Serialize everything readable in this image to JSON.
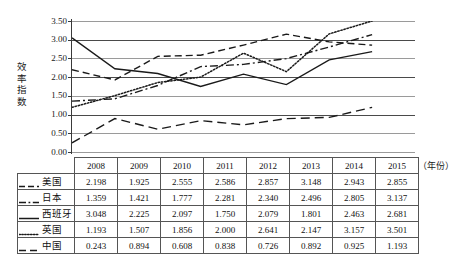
{
  "figure": {
    "y_axis_title": "效率指数",
    "y_axis_title_chars": [
      "效",
      "率",
      "指",
      "数"
    ],
    "x_axis_note": "（年份）",
    "y_ticks": [
      "3.50",
      "3.00",
      "2.50",
      "2.00",
      "1.50",
      "1.00",
      "0.50",
      "0.00"
    ]
  },
  "chart_data": {
    "type": "line",
    "title": "",
    "xlabel": "（年份）",
    "ylabel": "效率指数",
    "ylim": [
      0.0,
      3.5
    ],
    "yticks": [
      0.0,
      0.5,
      1.0,
      1.5,
      2.0,
      2.5,
      3.0,
      3.5
    ],
    "grid": true,
    "legend_position": "table-row-headers",
    "categories": [
      "2008",
      "2009",
      "2010",
      "2011",
      "2012",
      "2013",
      "2014",
      "2015"
    ],
    "series": [
      {
        "name": "美国",
        "style": "dashed",
        "color": "#1a1a1a",
        "values": [
          2.198,
          1.925,
          2.555,
          2.586,
          2.857,
          3.148,
          2.943,
          2.855
        ]
      },
      {
        "name": "日本",
        "style": "dash-dot",
        "color": "#1a1a1a",
        "values": [
          1.359,
          1.421,
          1.777,
          2.281,
          2.34,
          2.496,
          2.805,
          3.137
        ]
      },
      {
        "name": "西班牙",
        "style": "solid",
        "color": "#1a1a1a",
        "values": [
          3.048,
          2.225,
          2.097,
          1.75,
          2.079,
          1.801,
          2.463,
          2.681
        ]
      },
      {
        "name": "英国",
        "style": "dotted",
        "color": "#1a1a1a",
        "values": [
          1.193,
          1.507,
          1.856,
          2.0,
          2.641,
          2.147,
          3.157,
          3.501
        ]
      },
      {
        "name": "中国",
        "style": "long-dash",
        "color": "#1a1a1a",
        "values": [
          0.243,
          0.894,
          0.608,
          0.838,
          0.726,
          0.892,
          0.925,
          1.193
        ]
      }
    ]
  },
  "table": {
    "year_headers": [
      "2008",
      "2009",
      "2010",
      "2011",
      "2012",
      "2013",
      "2014",
      "2015"
    ],
    "rows": [
      {
        "label": "美国",
        "style": "dashed",
        "values": [
          "2.198",
          "1.925",
          "2.555",
          "2.586",
          "2.857",
          "3.148",
          "2.943",
          "2.855"
        ]
      },
      {
        "label": "日本",
        "style": "dash-dot",
        "values": [
          "1.359",
          "1.421",
          "1.777",
          "2.281",
          "2.340",
          "2.496",
          "2.805",
          "3.137"
        ]
      },
      {
        "label": "西班牙",
        "style": "solid",
        "values": [
          "3.048",
          "2.225",
          "2.097",
          "1.750",
          "2.079",
          "1.801",
          "2.463",
          "2.681"
        ]
      },
      {
        "label": "英国",
        "style": "dotted",
        "values": [
          "1.193",
          "1.507",
          "1.856",
          "2.000",
          "2.641",
          "2.147",
          "3.157",
          "3.501"
        ]
      },
      {
        "label": "中国",
        "style": "long-dash",
        "values": [
          "0.243",
          "0.894",
          "0.608",
          "0.838",
          "0.726",
          "0.892",
          "0.925",
          "1.193"
        ]
      }
    ]
  }
}
